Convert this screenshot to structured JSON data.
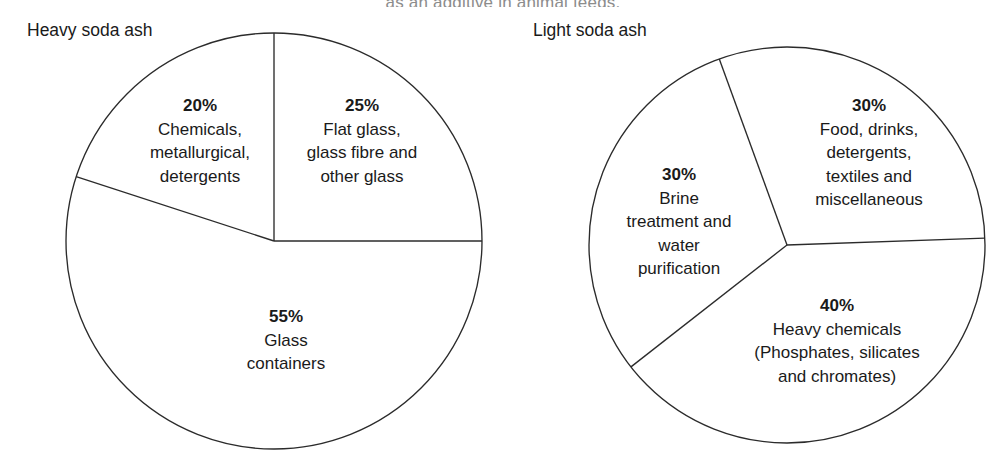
{
  "figure": {
    "clipped_text_above": "as an additive in animal feeds.",
    "background_color": "#ffffff",
    "stroke_color": "#2b2b2b"
  },
  "charts": [
    {
      "id": "heavy-soda-ash",
      "title": "Heavy soda ash",
      "slices": [
        {
          "percent_label": "25%",
          "value": 25,
          "description_lines": [
            "Flat glass,",
            "glass fibre and",
            "other glass"
          ],
          "label_x": 362,
          "label_y": 141
        },
        {
          "percent_label": "55%",
          "value": 55,
          "description_lines": [
            "Glass",
            "containers"
          ],
          "label_x": 286,
          "label_y": 340
        },
        {
          "percent_label": "20%",
          "value": 20,
          "description_lines": [
            "Chemicals,",
            "metallurgical,",
            "detergents"
          ],
          "label_x": 200,
          "label_y": 141
        }
      ]
    },
    {
      "id": "light-soda-ash",
      "title": "Light soda ash",
      "slices": [
        {
          "percent_label": "30%",
          "value": 30,
          "description_lines": [
            "Food, drinks,",
            "detergents,",
            "textiles and",
            "miscellaneous"
          ],
          "label_x": 869,
          "label_y": 153
        },
        {
          "percent_label": "40%",
          "value": 40,
          "description_lines": [
            "Heavy chemicals",
            "(Phosphates, silicates",
            "and chromates)"
          ],
          "label_x": 837,
          "label_y": 341
        },
        {
          "percent_label": "30%",
          "value": 30,
          "description_lines": [
            "Brine",
            "treatment and",
            "water",
            "purification"
          ],
          "label_x": 679,
          "label_y": 222
        }
      ]
    }
  ],
  "chart_data": [
    {
      "type": "pie",
      "title": "Heavy soda ash",
      "categories": [
        "Flat glass, glass fibre and other glass",
        "Glass containers",
        "Chemicals, metallurgical, detergents"
      ],
      "values": [
        25,
        55,
        20
      ],
      "value_labels": [
        "25%",
        "55%",
        "20%"
      ],
      "unit": "percent",
      "legend": "none",
      "labels_position": "inside-slice",
      "start_angle_deg": 0,
      "direction": "clockwise",
      "center": [
        274,
        241
      ],
      "radius": 208,
      "fill": "none",
      "stroke": "#2b2b2b"
    },
    {
      "type": "pie",
      "title": "Light soda ash",
      "categories": [
        "Food, drinks, detergents, textiles and miscellaneous",
        "Heavy chemicals (Phosphates, silicates and chromates)",
        "Brine treatment and water purification"
      ],
      "values": [
        30,
        40,
        30
      ],
      "value_labels": [
        "30%",
        "40%",
        "30%"
      ],
      "unit": "percent",
      "legend": "none",
      "labels_position": "inside-slice",
      "start_angle_deg": -20,
      "direction": "clockwise",
      "center": [
        787,
        245
      ],
      "radius": 198,
      "fill": "none",
      "stroke": "#2b2b2b"
    }
  ]
}
